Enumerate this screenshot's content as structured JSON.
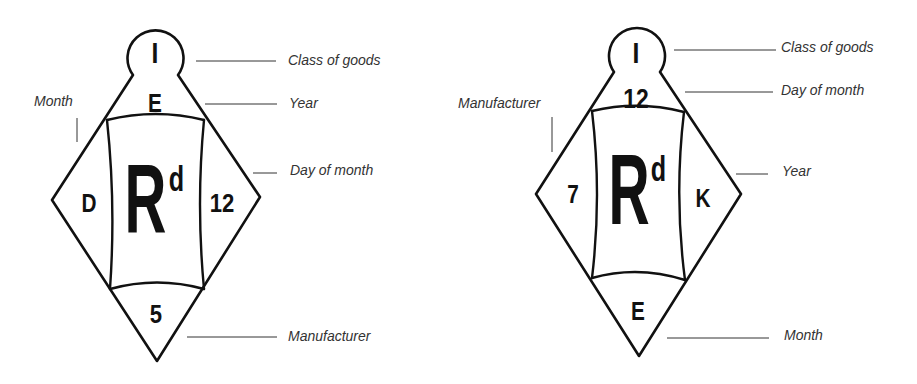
{
  "diagrams": [
    {
      "name": "left-diamond",
      "cells": {
        "top_circle": "I",
        "top_triangle": "E",
        "left_triangle": "D",
        "right_triangle": "12",
        "bottom_triangle": "5",
        "center": "R",
        "center_superscript": "d"
      },
      "labels": {
        "top_circle": "Class of goods",
        "top_triangle": "Year",
        "left_triangle": "Month",
        "right_triangle": "Day of month",
        "bottom_triangle": "Manufacturer"
      }
    },
    {
      "name": "right-diamond",
      "cells": {
        "top_circle": "I",
        "top_triangle": "12",
        "left_triangle": "7",
        "right_triangle": "K",
        "bottom_triangle": "E",
        "center": "R",
        "center_superscript": "d"
      },
      "labels": {
        "top_circle": "Class of goods",
        "top_triangle": "Day of month",
        "left_triangle": "Manufacturer",
        "right_triangle": "Year",
        "bottom_triangle": "Month"
      }
    }
  ],
  "colors": {
    "ink": "#111111",
    "label_text": "#333333",
    "background": "#ffffff"
  }
}
